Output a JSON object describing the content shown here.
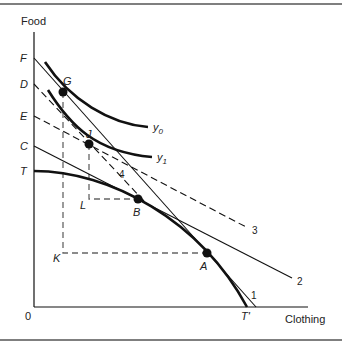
{
  "figure": {
    "axes": {
      "y_label": "Food",
      "x_label": "Clothing",
      "origin": "0"
    },
    "y_axis_points": [
      "F",
      "D",
      "E",
      "C",
      "T"
    ],
    "x_axis_points": [
      "T'"
    ],
    "points": {
      "G": "G",
      "J": "J",
      "B": "B",
      "A": "A",
      "L": "L",
      "K": "K"
    },
    "curves": {
      "y0": "y",
      "y0_sub": "0",
      "y1": "y",
      "y1_sub": "1"
    },
    "line_labels": {
      "l1": "1",
      "l2": "2",
      "l3": "3",
      "l4": "4"
    }
  },
  "colors": {
    "ink": "#111111",
    "frame": "#555555",
    "dash": "#666666"
  }
}
